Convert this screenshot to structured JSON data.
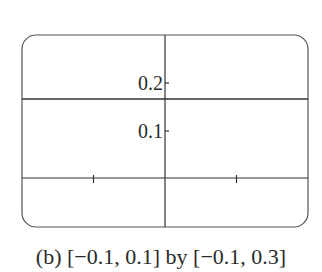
{
  "chart_data": {
    "type": "line",
    "title": "",
    "caption": "(b) [−0.1, 0.1] by [−0.1, 0.3]",
    "xlabel": "",
    "ylabel": "",
    "xlim": [
      -0.1,
      0.1
    ],
    "ylim": [
      -0.1,
      0.3
    ],
    "x_ticks": [
      -0.05,
      0.05
    ],
    "y_ticks": [
      0.1,
      0.2
    ],
    "y_tick_labels": [
      "0.1",
      "0.2"
    ],
    "grid": false,
    "series": [
      {
        "name": "horizontal line",
        "x": [
          -0.1,
          0.1
        ],
        "values": [
          0.1667,
          0.1667
        ]
      }
    ]
  },
  "caption": "(b) [−0.1, 0.1] by [−0.1, 0.3]"
}
